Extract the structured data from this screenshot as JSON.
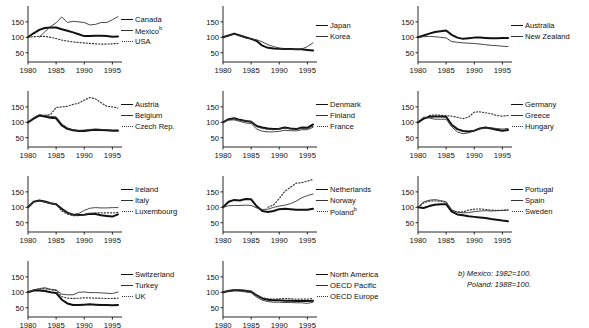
{
  "figure": {
    "width": 589,
    "height": 328,
    "y_ticks": [
      50,
      100,
      150
    ],
    "x_ticks": [
      1980,
      1985,
      1990,
      1995
    ],
    "x_range": [
      1980,
      1996
    ],
    "y_range": [
      20,
      195
    ],
    "index_base": "1980=100",
    "grid": false,
    "legend_position": "right-of-each-panel"
  },
  "footnote": {
    "line1": "b) Mexico: 1982=100.",
    "line2": "Poland: 1988=100."
  },
  "styles": {
    "thick": "#111111",
    "thin": "#333333",
    "dotted": "#333333"
  },
  "chart_data": [
    {
      "type": "line",
      "panel": 1,
      "title": "",
      "xlabel": "",
      "ylabel": "",
      "x": [
        1980,
        1981,
        1982,
        1983,
        1984,
        1985,
        1986,
        1987,
        1988,
        1989,
        1990,
        1991,
        1992,
        1993,
        1994,
        1995,
        1996
      ],
      "xlim": [
        1980,
        1996
      ],
      "ylim": [
        20,
        195
      ],
      "yticks": [
        50,
        100,
        150
      ],
      "xticks": [
        1980,
        1985,
        1990,
        1995
      ],
      "series": [
        {
          "name": "Canada",
          "style": "thick",
          "values": [
            100,
            113,
            124,
            130,
            132,
            132,
            126,
            121,
            116,
            110,
            104,
            104,
            105,
            105,
            104,
            102,
            103
          ]
        },
        {
          "name": "Mexico",
          "style": "thin",
          "note": "b",
          "values": [
            null,
            null,
            100,
            118,
            135,
            147,
            166,
            148,
            152,
            150,
            148,
            140,
            142,
            148,
            148,
            157,
            167
          ]
        },
        {
          "name": "USA",
          "style": "dotted",
          "values": [
            100,
            102,
            103,
            103,
            100,
            96,
            91,
            88,
            85,
            83,
            82,
            80,
            79,
            78,
            78,
            79,
            80
          ]
        }
      ]
    },
    {
      "type": "line",
      "panel": 2,
      "x": [
        1980,
        1981,
        1982,
        1983,
        1984,
        1985,
        1986,
        1987,
        1988,
        1989,
        1990,
        1991,
        1992,
        1993,
        1994,
        1995,
        1996
      ],
      "xlim": [
        1980,
        1996
      ],
      "ylim": [
        20,
        195
      ],
      "yticks": [
        50,
        100,
        150
      ],
      "xticks": [
        1980,
        1985,
        1990,
        1995
      ],
      "series": [
        {
          "name": "Japan",
          "style": "thick",
          "values": [
            100,
            106,
            112,
            106,
            100,
            95,
            88,
            73,
            66,
            64,
            63,
            62,
            62,
            61,
            61,
            59,
            57
          ]
        },
        {
          "name": "Korea",
          "style": "thin",
          "values": [
            100,
            105,
            110,
            105,
            98,
            95,
            92,
            85,
            76,
            70,
            65,
            62,
            61,
            61,
            62,
            70,
            82
          ]
        }
      ]
    },
    {
      "type": "line",
      "panel": 3,
      "x": [
        1980,
        1981,
        1982,
        1983,
        1984,
        1985,
        1986,
        1987,
        1988,
        1989,
        1990,
        1991,
        1992,
        1993,
        1994,
        1995,
        1996
      ],
      "xlim": [
        1980,
        1996
      ],
      "ylim": [
        20,
        195
      ],
      "yticks": [
        50,
        100,
        150
      ],
      "xticks": [
        1980,
        1985,
        1990,
        1995
      ],
      "series": [
        {
          "name": "Australia",
          "style": "thick",
          "values": [
            100,
            106,
            112,
            117,
            120,
            122,
            108,
            99,
            95,
            97,
            99,
            99,
            98,
            97,
            97,
            98,
            98
          ]
        },
        {
          "name": "New Zealand",
          "style": "thin",
          "values": [
            100,
            102,
            103,
            102,
            100,
            98,
            86,
            84,
            82,
            81,
            80,
            78,
            76,
            74,
            73,
            71,
            70
          ]
        }
      ]
    },
    {
      "type": "line",
      "panel": 4,
      "x": [
        1980,
        1981,
        1982,
        1983,
        1984,
        1985,
        1986,
        1987,
        1988,
        1989,
        1990,
        1991,
        1992,
        1993,
        1994,
        1995,
        1996
      ],
      "xlim": [
        1980,
        1996
      ],
      "ylim": [
        20,
        195
      ],
      "yticks": [
        50,
        100,
        150
      ],
      "xticks": [
        1980,
        1985,
        1990,
        1995
      ],
      "series": [
        {
          "name": "Austria",
          "style": "thick",
          "values": [
            100,
            112,
            122,
            119,
            115,
            113,
            90,
            79,
            74,
            72,
            72,
            74,
            76,
            75,
            74,
            73,
            73
          ]
        },
        {
          "name": "Belgium",
          "style": "thin",
          "values": [
            100,
            115,
            125,
            122,
            119,
            118,
            95,
            82,
            76,
            74,
            75,
            77,
            78,
            77,
            76,
            75,
            75
          ]
        },
        {
          "name": "Czech Rep.",
          "style": "dotted",
          "values": [
            null,
            null,
            null,
            123,
            125,
            148,
            150,
            152,
            158,
            162,
            172,
            180,
            176,
            163,
            152,
            150,
            146
          ]
        }
      ]
    },
    {
      "type": "line",
      "panel": 5,
      "x": [
        1980,
        1981,
        1982,
        1983,
        1984,
        1985,
        1986,
        1987,
        1988,
        1989,
        1990,
        1991,
        1992,
        1993,
        1994,
        1995,
        1996
      ],
      "xlim": [
        1980,
        1996
      ],
      "ylim": [
        20,
        195
      ],
      "yticks": [
        50,
        100,
        150
      ],
      "xticks": [
        1980,
        1985,
        1990,
        1995
      ],
      "series": [
        {
          "name": "Denmark",
          "style": "thick",
          "values": [
            100,
            110,
            113,
            108,
            104,
            102,
            88,
            83,
            80,
            78,
            79,
            83,
            80,
            78,
            83,
            82,
            93
          ]
        },
        {
          "name": "Finland",
          "style": "thin",
          "values": [
            100,
            107,
            108,
            103,
            98,
            96,
            78,
            71,
            69,
            69,
            71,
            74,
            73,
            72,
            76,
            76,
            84
          ]
        },
        {
          "name": "France",
          "style": "dotted",
          "values": [
            100,
            110,
            112,
            107,
            105,
            103,
            86,
            80,
            77,
            76,
            79,
            82,
            79,
            77,
            81,
            80,
            88
          ]
        }
      ]
    },
    {
      "type": "line",
      "panel": 6,
      "x": [
        1980,
        1981,
        1982,
        1983,
        1984,
        1985,
        1986,
        1987,
        1988,
        1989,
        1990,
        1991,
        1992,
        1993,
        1994,
        1995,
        1996
      ],
      "xlim": [
        1980,
        1996
      ],
      "ylim": [
        20,
        195
      ],
      "yticks": [
        50,
        100,
        150
      ],
      "xticks": [
        1980,
        1985,
        1990,
        1995
      ],
      "series": [
        {
          "name": "Germany",
          "style": "thick",
          "values": [
            100,
            112,
            118,
            119,
            119,
            118,
            92,
            78,
            72,
            70,
            73,
            80,
            83,
            80,
            76,
            73,
            75
          ]
        },
        {
          "name": "Greece",
          "style": "thin",
          "values": [
            100,
            117,
            114,
            110,
            110,
            110,
            85,
            69,
            63,
            66,
            73,
            80,
            82,
            82,
            80,
            78,
            80
          ]
        },
        {
          "name": "Hungary",
          "style": "dotted",
          "values": [
            null,
            null,
            122,
            124,
            123,
            122,
            120,
            116,
            112,
            117,
            133,
            134,
            131,
            128,
            122,
            120,
            122
          ]
        }
      ]
    },
    {
      "type": "line",
      "panel": 7,
      "x": [
        1980,
        1981,
        1982,
        1983,
        1984,
        1985,
        1986,
        1987,
        1988,
        1989,
        1990,
        1991,
        1992,
        1993,
        1994,
        1995,
        1996
      ],
      "xlim": [
        1980,
        1996
      ],
      "ylim": [
        20,
        195
      ],
      "yticks": [
        50,
        100,
        150
      ],
      "xticks": [
        1980,
        1985,
        1990,
        1995
      ],
      "series": [
        {
          "name": "Ireland",
          "style": "thick",
          "values": [
            100,
            118,
            122,
            119,
            113,
            110,
            95,
            83,
            76,
            75,
            76,
            79,
            78,
            74,
            72,
            70,
            77
          ]
        },
        {
          "name": "Italy",
          "style": "thin",
          "values": [
            100,
            118,
            121,
            117,
            112,
            110,
            93,
            82,
            77,
            80,
            90,
            97,
            99,
            98,
            98,
            99,
            99
          ]
        },
        {
          "name": "Luxembourg",
          "style": "dotted",
          "values": [
            100,
            118,
            120,
            117,
            113,
            112,
            88,
            78,
            73,
            73,
            76,
            80,
            82,
            82,
            82,
            82,
            83
          ]
        }
      ]
    },
    {
      "type": "line",
      "panel": 8,
      "x": [
        1980,
        1981,
        1982,
        1983,
        1984,
        1985,
        1986,
        1987,
        1988,
        1989,
        1990,
        1991,
        1992,
        1993,
        1994,
        1995,
        1996
      ],
      "xlim": [
        1980,
        1996
      ],
      "ylim": [
        20,
        195
      ],
      "yticks": [
        50,
        100,
        150
      ],
      "xticks": [
        1980,
        1985,
        1990,
        1995
      ],
      "series": [
        {
          "name": "Netherlands",
          "style": "thick",
          "values": [
            100,
            118,
            124,
            122,
            127,
            126,
            103,
            88,
            85,
            88,
            94,
            95,
            94,
            92,
            92,
            92,
            95
          ]
        },
        {
          "name": "Norway",
          "style": "thin",
          "values": [
            100,
            105,
            106,
            106,
            107,
            106,
            98,
            93,
            94,
            100,
            104,
            107,
            112,
            120,
            131,
            138,
            143
          ]
        },
        {
          "name": "Poland",
          "style": "dotted",
          "note": "b",
          "values": [
            null,
            null,
            null,
            null,
            null,
            null,
            null,
            null,
            100,
            108,
            128,
            152,
            165,
            178,
            180,
            185,
            190
          ]
        }
      ]
    },
    {
      "type": "line",
      "panel": 9,
      "x": [
        1980,
        1981,
        1982,
        1983,
        1984,
        1985,
        1986,
        1987,
        1988,
        1989,
        1990,
        1991,
        1992,
        1993,
        1994,
        1995,
        1996
      ],
      "xlim": [
        1980,
        1996
      ],
      "ylim": [
        20,
        195
      ],
      "yticks": [
        50,
        100,
        150
      ],
      "xticks": [
        1980,
        1985,
        1990,
        1995
      ],
      "series": [
        {
          "name": "Portugal",
          "style": "thick",
          "values": [
            100,
            98,
            104,
            108,
            110,
            110,
            86,
            77,
            74,
            71,
            69,
            67,
            65,
            62,
            60,
            57,
            55
          ]
        },
        {
          "name": "Spain",
          "style": "thin",
          "values": [
            100,
            118,
            123,
            125,
            122,
            118,
            92,
            84,
            82,
            83,
            86,
            88,
            89,
            88,
            89,
            90,
            91
          ]
        },
        {
          "name": "Sweden",
          "style": "dotted",
          "values": [
            100,
            114,
            120,
            121,
            119,
            116,
            90,
            85,
            85,
            91,
            94,
            95,
            93,
            91,
            90,
            90,
            92
          ]
        }
      ]
    },
    {
      "type": "line",
      "panel": 10,
      "x": [
        1980,
        1981,
        1982,
        1983,
        1984,
        1985,
        1986,
        1987,
        1988,
        1989,
        1990,
        1991,
        1992,
        1993,
        1994,
        1995,
        1996
      ],
      "xlim": [
        1980,
        1996
      ],
      "ylim": [
        20,
        195
      ],
      "yticks": [
        50,
        100,
        150
      ],
      "xticks": [
        1980,
        1985,
        1990,
        1995
      ],
      "series": [
        {
          "name": "Switzerland",
          "style": "thick",
          "values": [
            100,
            106,
            106,
            104,
            100,
            98,
            76,
            64,
            59,
            59,
            60,
            61,
            60,
            59,
            59,
            58,
            59
          ]
        },
        {
          "name": "Turkey",
          "style": "thin",
          "values": [
            100,
            108,
            112,
            115,
            110,
            108,
            94,
            92,
            92,
            100,
            101,
            99,
            99,
            98,
            97,
            96,
            101
          ]
        },
        {
          "name": "UK",
          "style": "dotted",
          "values": [
            100,
            108,
            110,
            112,
            108,
            106,
            86,
            81,
            80,
            81,
            82,
            82,
            81,
            81,
            80,
            80,
            81
          ]
        }
      ]
    },
    {
      "type": "line",
      "panel": 11,
      "x": [
        1980,
        1981,
        1982,
        1983,
        1984,
        1985,
        1986,
        1987,
        1988,
        1989,
        1990,
        1991,
        1992,
        1993,
        1994,
        1995,
        1996
      ],
      "xlim": [
        1980,
        1996
      ],
      "ylim": [
        20,
        195
      ],
      "yticks": [
        50,
        100,
        150
      ],
      "xticks": [
        1980,
        1985,
        1990,
        1995
      ],
      "series": [
        {
          "name": "North America",
          "style": "thick",
          "values": [
            100,
            104,
            107,
            107,
            105,
            102,
            90,
            80,
            76,
            74,
            74,
            73,
            73,
            72,
            72,
            72,
            73
          ]
        },
        {
          "name": "OECD Pacific",
          "style": "thin",
          "values": [
            100,
            103,
            105,
            104,
            101,
            99,
            84,
            74,
            70,
            68,
            68,
            67,
            67,
            66,
            66,
            64,
            68
          ]
        },
        {
          "name": "OECD Europe",
          "style": "dotted",
          "values": [
            100,
            106,
            109,
            108,
            106,
            104,
            90,
            82,
            79,
            78,
            79,
            80,
            79,
            78,
            78,
            78,
            80
          ]
        }
      ]
    }
  ]
}
